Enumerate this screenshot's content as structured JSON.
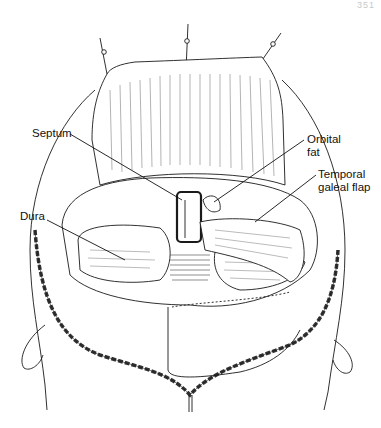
{
  "figure": {
    "page_number": "351",
    "labels": {
      "septum": "Septum",
      "dura": "Dura",
      "orbital_fat_line1": "Orbital",
      "orbital_fat_line2": "fat",
      "temporal_line1": "Temporal",
      "temporal_line2": "galeal flap"
    },
    "colors": {
      "line": "#1a1a1a",
      "background": "#ffffff",
      "hatch": "#555555"
    }
  }
}
